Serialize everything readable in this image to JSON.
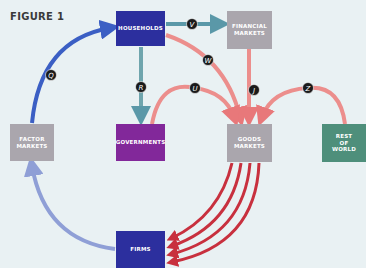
{
  "figure": {
    "title": "FIGURE 1"
  },
  "nodes": {
    "households": {
      "label": "HOUSEHOLDS",
      "color": "#2c2f9e"
    },
    "financial_markets": {
      "label": "FINANCIAL\nMARKETS",
      "color": "#aaa6ad"
    },
    "factor_markets": {
      "label": "FACTOR\nMARKETS",
      "color": "#aaa6ad"
    },
    "governments": {
      "label": "GOVERNMENTS",
      "color": "#82289a"
    },
    "goods_markets": {
      "label": "GOODS\nMARKETS",
      "color": "#aaa6ad"
    },
    "rest_of_world": {
      "label": "REST\nOF\nWORLD",
      "color": "#4e8f7b"
    },
    "firms": {
      "label": "FIRMS",
      "color": "#2c2f9e"
    }
  },
  "flows": {
    "Q": {
      "label": "Q",
      "from": "factor_markets",
      "to": "households"
    },
    "R": {
      "label": "R",
      "from": "households",
      "to": "governments"
    },
    "V": {
      "label": "V",
      "from": "households",
      "to": "financial_markets"
    },
    "W": {
      "label": "W",
      "from": "households",
      "to": "goods_markets"
    },
    "U": {
      "label": "U",
      "from": "governments",
      "to": "goods_markets"
    },
    "J": {
      "label": "J",
      "from": "financial_markets",
      "to": "goods_markets"
    },
    "Z": {
      "label": "Z",
      "from": "rest_of_world",
      "to": "goods_markets"
    },
    "firms_to_factor": {
      "label": "",
      "from": "firms",
      "to": "factor_markets"
    },
    "goods_to_firms": {
      "label": "",
      "from": "goods_markets",
      "to": "firms",
      "count": 4
    }
  },
  "colors": {
    "background": "#e9f1f3",
    "blue_flow": "#3b5fc4",
    "light_blue_flow": "#8f9fd6",
    "red_flow": "#c8303e",
    "pink_flow": "#ec8e8c",
    "teal_flow": "#5a98a8",
    "badge": "#1a1a1a"
  }
}
